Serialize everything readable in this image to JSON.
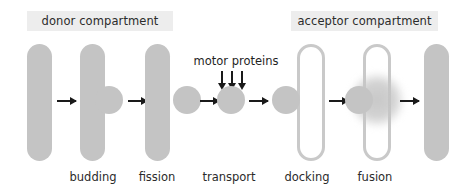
{
  "figure": {
    "type": "vesicle-transport-diagram",
    "background_color": "#ffffff",
    "membrane_fill_color": "#c4c4c4",
    "band_color": "#ededed",
    "arrow_color": "#1a1a1a",
    "text_color": "#2b2b2b"
  },
  "compartments": {
    "donor": {
      "label": "donor compartment"
    },
    "acceptor": {
      "label": "acceptor compartment"
    }
  },
  "annotations": {
    "motor_proteins": {
      "label": "motor proteins",
      "arrow_count": 3,
      "arrow_direction": "down"
    }
  },
  "steps": [
    {
      "key": "budding",
      "label": "budding"
    },
    {
      "key": "fission",
      "label": "fission"
    },
    {
      "key": "transport",
      "label": "transport"
    },
    {
      "key": "docking",
      "label": "docking"
    },
    {
      "key": "fusion",
      "label": "fusion"
    }
  ]
}
